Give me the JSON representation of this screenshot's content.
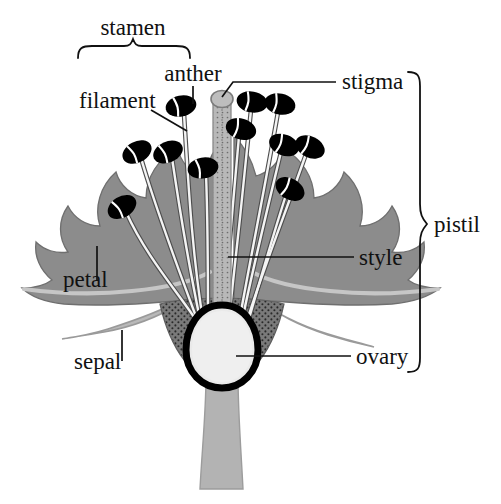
{
  "figure": {
    "background_color": "#ffffff",
    "width": 501,
    "height": 504
  },
  "palette": {
    "petal_fill": "#8c8c8c",
    "petal_edge_highlight": "#c2c2c2",
    "petal_outline": "#6f6f6f",
    "sepal_fill": "#b9b9b9",
    "sepal_outline": "#9a9a9a",
    "stem_fill": "#b3b3b3",
    "style_fill": "#b8b8b8",
    "style_outline": "#8a8a8a",
    "receptacle_fill": "#7a7a7a",
    "receptacle_stipple": "#2e2e2e",
    "ovary_outline": "#000000",
    "ovary_fill": "#e8e8e8",
    "anther_fill": "#000000",
    "anther_highlight": "#ffffff",
    "filament_fill": "#f2f2f2",
    "filament_outline": "#555555",
    "text_color": "#111111",
    "leader_color": "#111111"
  },
  "labels": {
    "stamen": "stamen",
    "anther": "anther",
    "filament": "filament",
    "stigma": "stigma",
    "pistil": "pistil",
    "style": "style",
    "petal": "petal",
    "sepal": "sepal",
    "ovary": "ovary"
  },
  "label_positions": {
    "stamen": {
      "x": 133,
      "y": 31,
      "align": "mid"
    },
    "anther": {
      "x": 193,
      "y": 78,
      "align": "mid"
    },
    "filament": {
      "x": 79,
      "y": 105,
      "align": "start"
    },
    "stigma": {
      "x": 342,
      "y": 86,
      "align": "start"
    },
    "pistil": {
      "x": 434,
      "y": 233,
      "align": "start"
    },
    "style": {
      "x": 359,
      "y": 265,
      "align": "start"
    },
    "petal": {
      "x": 63,
      "y": 287,
      "align": "start"
    },
    "sepal": {
      "x": 74,
      "y": 369,
      "align": "start"
    },
    "ovary": {
      "x": 356,
      "y": 364,
      "align": "start"
    }
  },
  "parts": {
    "stamen": {
      "name": "stamen",
      "description": "bracket grouping anther and filament"
    },
    "anther": {
      "name": "anther",
      "count": 11,
      "description": "black pollen sacs at filament tips"
    },
    "filament": {
      "name": "filament",
      "description": "slender white stalks supporting anthers"
    },
    "stigma": {
      "name": "stigma",
      "description": "knob at the top of the style"
    },
    "style": {
      "name": "style",
      "description": "central stippled column"
    },
    "ovary": {
      "name": "ovary",
      "description": "egg-shaped chamber at the flower base"
    },
    "petal": {
      "name": "petal",
      "description": "broad gray lobed corolla"
    },
    "sepal": {
      "name": "sepal",
      "description": "light gray leaf beneath the petals"
    },
    "pistil": {
      "name": "pistil",
      "description": "bracket grouping stigma, style and ovary"
    }
  },
  "anthers": [
    {
      "cx": 122,
      "cy": 207,
      "rot": -32
    },
    {
      "cx": 137,
      "cy": 152,
      "rot": -28
    },
    {
      "cx": 168,
      "cy": 152,
      "rot": -24
    },
    {
      "cx": 181,
      "cy": 106,
      "rot": -12
    },
    {
      "cx": 203,
      "cy": 168,
      "rot": -10
    },
    {
      "cx": 241,
      "cy": 129,
      "rot": 16
    },
    {
      "cx": 252,
      "cy": 102,
      "rot": 10
    },
    {
      "cx": 280,
      "cy": 104,
      "rot": 12
    },
    {
      "cx": 284,
      "cy": 145,
      "rot": 22
    },
    {
      "cx": 310,
      "cy": 147,
      "rot": 26
    },
    {
      "cx": 290,
      "cy": 189,
      "rot": 30
    }
  ],
  "braces": {
    "stamen": {
      "orientation": "horizontal",
      "x1": 78,
      "x2": 190,
      "y": 50,
      "tip_x": 133,
      "tip_y": 40
    },
    "pistil": {
      "orientation": "vertical",
      "y1": 72,
      "y2": 372,
      "x": 408,
      "tip_x": 424,
      "tip_y": 224
    }
  },
  "leaders": [
    {
      "for": "anther",
      "points": "193,86 193,104"
    },
    {
      "for": "filament",
      "points": "151,110 187,131"
    },
    {
      "for": "stigma",
      "points": "222,97 233,82 336,82"
    },
    {
      "for": "style",
      "points": "228,257 354,257"
    },
    {
      "for": "ovary",
      "points": "236,356 351,356"
    },
    {
      "for": "petal",
      "points": "97,246 97,281"
    },
    {
      "for": "sepal",
      "points": "122,330 122,361"
    }
  ]
}
